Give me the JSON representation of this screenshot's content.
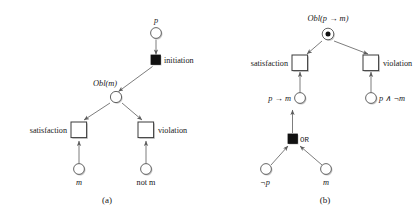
{
  "figure": {
    "kind": "petri-net-diagram-pair",
    "background_color": "#ffffff",
    "line_color": "#6e6e6e",
    "fill_color": "#ffffff",
    "token_color": "#111111",
    "panels": [
      {
        "id": "a",
        "caption": "(a)",
        "places": [
          {
            "name": "p-place",
            "label": "p",
            "italic": true,
            "label_position": "above",
            "token": false
          },
          {
            "name": "obl-m-place",
            "label": "Obl(m)",
            "italic": true,
            "label_position": "left-above",
            "token": false
          },
          {
            "name": "m-place",
            "label": "m",
            "italic": true,
            "label_position": "below",
            "token": false
          },
          {
            "name": "not-m-place",
            "label": "not m",
            "italic": false,
            "label_position": "below",
            "token": false
          }
        ],
        "transitions": [
          {
            "name": "initiation-transition",
            "label": "initiation",
            "filled": true,
            "label_position": "right"
          },
          {
            "name": "satisfaction-transition",
            "label": "satisfaction",
            "filled": false,
            "label_position": "left"
          },
          {
            "name": "violation-transition",
            "label": "violation",
            "filled": false,
            "label_position": "right"
          }
        ],
        "arcs": [
          {
            "from": "p-place",
            "to": "initiation-transition"
          },
          {
            "from": "initiation-transition",
            "to": "obl-m-place"
          },
          {
            "from": "obl-m-place",
            "to": "satisfaction-transition"
          },
          {
            "from": "obl-m-place",
            "to": "violation-transition"
          },
          {
            "from": "m-place",
            "to": "satisfaction-transition"
          },
          {
            "from": "not-m-place",
            "to": "violation-transition"
          }
        ]
      },
      {
        "id": "b",
        "caption": "(b)",
        "places": [
          {
            "name": "obl-p-implies-m-place",
            "label": "Obl(p → m)",
            "italic": true,
            "label_position": "above",
            "token": true
          },
          {
            "name": "p-implies-m-place",
            "label": "p → m",
            "italic": true,
            "label_position": "left",
            "token": false
          },
          {
            "name": "p-and-not-m-place",
            "label": "p ∧ ¬m",
            "italic": true,
            "label_position": "right",
            "token": false
          },
          {
            "name": "not-p-place",
            "label": "¬p",
            "italic": true,
            "label_position": "below",
            "token": false
          },
          {
            "name": "m-place",
            "label": "m",
            "italic": true,
            "label_position": "below",
            "token": false
          }
        ],
        "transitions": [
          {
            "name": "satisfaction-transition",
            "label": "satisfaction",
            "filled": false,
            "label_position": "left"
          },
          {
            "name": "violation-transition",
            "label": "violation",
            "filled": false,
            "label_position": "right"
          },
          {
            "name": "or-transition",
            "label": "OR",
            "filled": true,
            "label_position": "right",
            "mono": true
          }
        ],
        "arcs": [
          {
            "from": "obl-p-implies-m-place",
            "to": "satisfaction-transition"
          },
          {
            "from": "obl-p-implies-m-place",
            "to": "violation-transition"
          },
          {
            "from": "p-implies-m-place",
            "to": "satisfaction-transition"
          },
          {
            "from": "p-and-not-m-place",
            "to": "violation-transition"
          },
          {
            "from": "or-transition",
            "to": "p-implies-m-place"
          },
          {
            "from": "not-p-place",
            "to": "or-transition"
          },
          {
            "from": "m-place",
            "to": "or-transition"
          }
        ]
      }
    ],
    "labels": {
      "a": {
        "p": "p",
        "initiation": "initiation",
        "obl_m": "Obl(m)",
        "satisfaction": "satisfaction",
        "violation": "violation",
        "m": "m",
        "not_m": "not m",
        "caption": "(a)"
      },
      "b": {
        "obl_p_implies_m": "Obl(p → m)",
        "satisfaction": "satisfaction",
        "violation": "violation",
        "p_implies_m": "p → m",
        "p_and_not_m": "p ∧ ¬m",
        "or": "OR",
        "not_p": "¬p",
        "m": "m",
        "caption": "(b)"
      }
    }
  }
}
